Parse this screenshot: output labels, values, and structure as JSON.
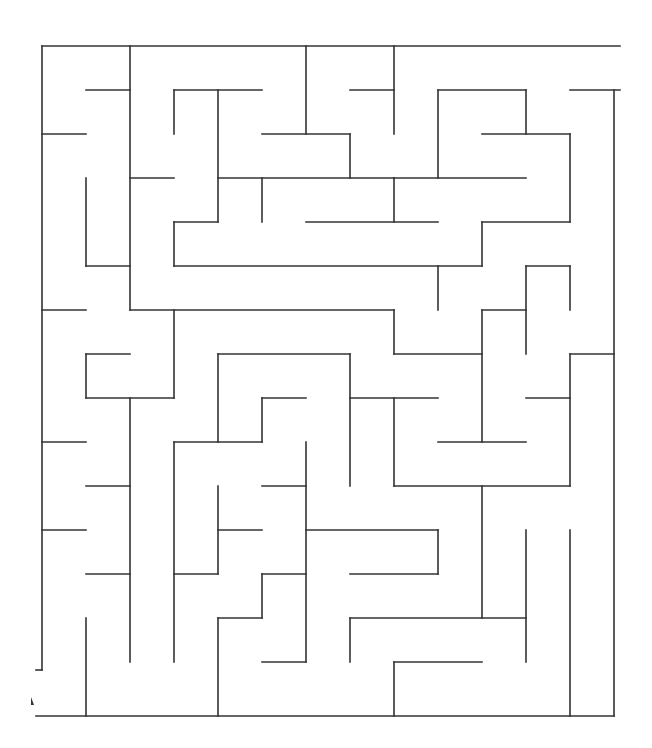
{
  "maze": {
    "width": 652,
    "height": 748,
    "origin_x": 42,
    "origin_y": 46,
    "cell": 44,
    "wall_color": "#333333",
    "background": "#ffffff",
    "segments_px": [
      [
        42,
        46,
        620,
        46
      ],
      [
        42,
        46,
        42,
        670
      ],
      [
        36,
        670,
        42,
        670
      ],
      [
        36,
        716,
        614,
        716
      ],
      [
        614,
        90,
        614,
        716
      ],
      [
        570,
        90,
        620,
        90
      ],
      [
        130,
        46,
        130,
        310
      ],
      [
        86,
        90,
        130,
        90
      ],
      [
        42,
        134,
        86,
        134
      ],
      [
        86,
        178,
        86,
        266
      ],
      [
        86,
        266,
        130,
        266
      ],
      [
        130,
        178,
        174,
        178
      ],
      [
        174,
        90,
        174,
        134
      ],
      [
        174,
        90,
        262,
        90
      ],
      [
        218,
        90,
        218,
        222
      ],
      [
        174,
        222,
        218,
        222
      ],
      [
        174,
        222,
        174,
        266
      ],
      [
        218,
        178,
        394,
        178
      ],
      [
        262,
        178,
        262,
        222
      ],
      [
        306,
        46,
        306,
        134
      ],
      [
        262,
        134,
        350,
        134
      ],
      [
        350,
        134,
        350,
        178
      ],
      [
        394,
        46,
        394,
        134
      ],
      [
        350,
        90,
        394,
        90
      ],
      [
        438,
        90,
        438,
        178
      ],
      [
        438,
        90,
        526,
        90
      ],
      [
        526,
        90,
        526,
        134
      ],
      [
        482,
        134,
        570,
        134
      ],
      [
        570,
        134,
        570,
        222
      ],
      [
        394,
        178,
        526,
        178
      ],
      [
        394,
        178,
        394,
        222
      ],
      [
        306,
        222,
        438,
        222
      ],
      [
        482,
        222,
        570,
        222
      ],
      [
        482,
        222,
        482,
        266
      ],
      [
        174,
        266,
        482,
        266
      ],
      [
        438,
        266,
        438,
        310
      ],
      [
        130,
        310,
        394,
        310
      ],
      [
        394,
        310,
        394,
        354
      ],
      [
        394,
        354,
        482,
        354
      ],
      [
        482,
        310,
        526,
        310
      ],
      [
        482,
        310,
        482,
        442
      ],
      [
        526,
        266,
        570,
        266
      ],
      [
        526,
        266,
        526,
        354
      ],
      [
        570,
        266,
        570,
        310
      ],
      [
        570,
        354,
        614,
        354
      ],
      [
        570,
        354,
        570,
        486
      ],
      [
        526,
        398,
        570,
        398
      ],
      [
        42,
        310,
        86,
        310
      ],
      [
        174,
        310,
        174,
        398
      ],
      [
        86,
        354,
        130,
        354
      ],
      [
        86,
        354,
        86,
        398
      ],
      [
        86,
        398,
        174,
        398
      ],
      [
        130,
        398,
        130,
        662
      ],
      [
        218,
        354,
        350,
        354
      ],
      [
        218,
        354,
        218,
        442
      ],
      [
        350,
        354,
        350,
        486
      ],
      [
        262,
        398,
        306,
        398
      ],
      [
        262,
        398,
        262,
        442
      ],
      [
        174,
        442,
        262,
        442
      ],
      [
        174,
        442,
        174,
        662
      ],
      [
        350,
        398,
        438,
        398
      ],
      [
        394,
        398,
        394,
        486
      ],
      [
        438,
        442,
        526,
        442
      ],
      [
        394,
        486,
        570,
        486
      ],
      [
        482,
        486,
        482,
        618
      ],
      [
        42,
        442,
        86,
        442
      ],
      [
        86,
        486,
        130,
        486
      ],
      [
        42,
        530,
        86,
        530
      ],
      [
        86,
        574,
        130,
        574
      ],
      [
        86,
        618,
        86,
        716
      ],
      [
        218,
        486,
        218,
        574
      ],
      [
        174,
        574,
        218,
        574
      ],
      [
        218,
        530,
        262,
        530
      ],
      [
        262,
        486,
        306,
        486
      ],
      [
        306,
        442,
        306,
        662
      ],
      [
        262,
        662,
        306,
        662
      ],
      [
        306,
        530,
        438,
        530
      ],
      [
        438,
        530,
        438,
        574
      ],
      [
        350,
        574,
        438,
        574
      ],
      [
        262,
        574,
        306,
        574
      ],
      [
        262,
        574,
        262,
        618
      ],
      [
        218,
        618,
        262,
        618
      ],
      [
        218,
        618,
        218,
        716
      ],
      [
        350,
        618,
        526,
        618
      ],
      [
        350,
        618,
        350,
        662
      ],
      [
        526,
        530,
        526,
        662
      ],
      [
        570,
        530,
        570,
        716
      ],
      [
        394,
        662,
        482,
        662
      ],
      [
        394,
        662,
        394,
        716
      ]
    ]
  }
}
